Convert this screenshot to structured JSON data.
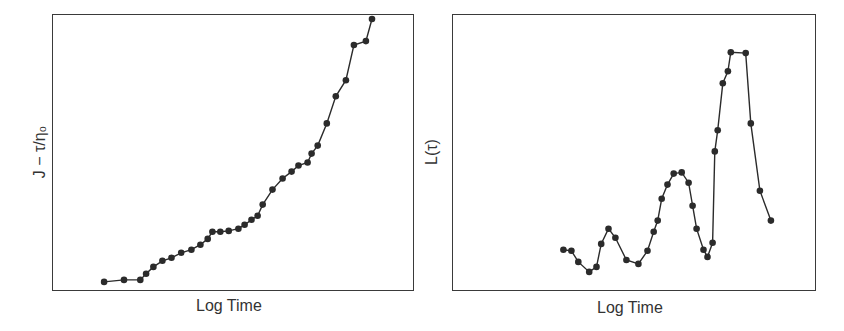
{
  "chart_data": [
    {
      "type": "line",
      "title": "",
      "xlabel": "Log Time",
      "ylabel": "J − τ/η₀",
      "grid": false,
      "legend": null,
      "ticks": false,
      "xlim": [
        0,
        100
      ],
      "ylim": [
        0,
        100
      ],
      "marker": "filled-circle",
      "color": "#2b2b2b",
      "x": [
        14.4,
        19.9,
        24.4,
        26.0,
        28.0,
        30.5,
        33.0,
        35.7,
        38.5,
        41.0,
        43.0,
        44.3,
        46.5,
        48.8,
        51.5,
        53.2,
        55.1,
        56.8,
        58.2,
        60.9,
        63.7,
        66.2,
        68.1,
        70.6,
        71.7,
        73.4,
        75.9,
        78.4,
        81.2,
        83.4,
        86.7,
        88.4
      ],
      "y": [
        3.3,
        4.0,
        4.0,
        6.2,
        8.7,
        10.9,
        12.0,
        13.8,
        14.9,
        16.7,
        18.8,
        21.4,
        21.4,
        21.7,
        22.5,
        23.9,
        25.7,
        27.2,
        31.2,
        36.6,
        40.6,
        43.1,
        45.3,
        46.4,
        49.6,
        52.5,
        60.5,
        70.3,
        76.1,
        88.8,
        90.2,
        98.2
      ]
    },
    {
      "type": "line",
      "title": "",
      "xlabel": "Log Time",
      "ylabel": "L(τ)",
      "grid": false,
      "legend": null,
      "ticks": false,
      "xlim": [
        0,
        100
      ],
      "ylim": [
        0,
        100
      ],
      "marker": "filled-circle",
      "color": "#2b2b2b",
      "x": [
        30.6,
        32.8,
        34.7,
        37.7,
        39.7,
        41.0,
        43.0,
        44.9,
        47.9,
        51.2,
        53.7,
        55.4,
        56.5,
        57.6,
        59.2,
        60.9,
        63.1,
        65.0,
        66.1,
        67.2,
        69.1,
        70.2,
        71.6,
        72.2,
        73.0,
        74.4,
        75.8,
        76.6,
        80.7,
        82.1,
        84.6,
        87.6
      ],
      "y": [
        14.9,
        14.5,
        10.5,
        6.9,
        8.7,
        17.0,
        22.5,
        19.2,
        11.2,
        9.8,
        14.5,
        21.4,
        25.4,
        33.3,
        38.4,
        42.4,
        42.8,
        39.1,
        30.8,
        22.5,
        14.9,
        12.3,
        17.4,
        50.4,
        58.0,
        75.0,
        79.3,
        86.2,
        85.9,
        60.5,
        36.2,
        25.4
      ]
    }
  ],
  "panels": [
    {
      "xlabel": "Log Time",
      "ylabel": "J − τ/η₀"
    },
    {
      "xlabel": "Log Time",
      "ylabel": "L(τ)"
    }
  ]
}
